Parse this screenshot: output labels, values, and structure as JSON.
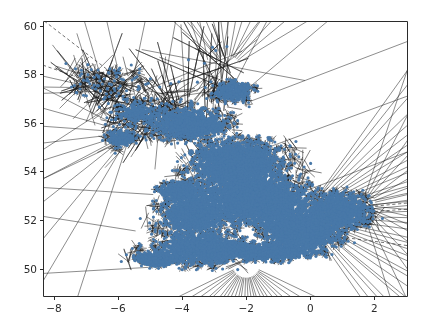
{
  "figure": {
    "background_color": "#ffffff",
    "axes_color": "#2b2b2b",
    "width": 427,
    "height": 334
  },
  "chart_data": {
    "type": "scatter",
    "title": "",
    "subtitle": "",
    "xlabel": "",
    "ylabel": "",
    "grid": false,
    "legend": null,
    "plot_kind": "voronoi-diagram",
    "xlim": [
      -8.34,
      3.02
    ],
    "ylim": [
      48.87,
      60.2
    ],
    "xticks": [
      -8,
      -6,
      -4,
      -2,
      0,
      2
    ],
    "xticklabels": [
      "−8",
      "−6",
      "−4",
      "−2",
      "0",
      "2"
    ],
    "yticks": [
      50,
      52,
      54,
      56,
      58,
      60
    ],
    "yticklabels": [
      "50",
      "52",
      "54",
      "56",
      "58",
      "60"
    ],
    "point_color": "#4878a8",
    "point_size": 2.0,
    "ridge_color": "#1a1a1a",
    "ridge_width": 0.55,
    "infinite_ridge_style": "dashed",
    "axes_box": {
      "left": 43,
      "top": 21,
      "right": 407,
      "bottom": 296
    },
    "clusters": [
      {
        "name": "scotland-northwest-sparse",
        "cx": -6.4,
        "cy": 57.6,
        "rx": 1.5,
        "ry": 1.2,
        "n": 70,
        "density": "sparse"
      },
      {
        "name": "scotland-central-belt",
        "cx": -3.9,
        "cy": 56.0,
        "rx": 1.3,
        "ry": 0.75,
        "n": 900,
        "density": "dense"
      },
      {
        "name": "scotland-aberdeen",
        "cx": -2.4,
        "cy": 57.3,
        "rx": 0.6,
        "ry": 0.45,
        "n": 420,
        "density": "dense"
      },
      {
        "name": "scotland-glasgow-edinburgh",
        "cx": -3.6,
        "cy": 55.9,
        "rx": 0.85,
        "ry": 0.35,
        "n": 1100,
        "density": "dense"
      },
      {
        "name": "northern-england",
        "cx": -2.3,
        "cy": 54.3,
        "rx": 1.5,
        "ry": 1.1,
        "n": 2600,
        "density": "dense"
      },
      {
        "name": "midlands",
        "cx": -1.6,
        "cy": 52.8,
        "rx": 1.6,
        "ry": 1.0,
        "n": 3400,
        "density": "very-dense"
      },
      {
        "name": "wales",
        "cx": -3.6,
        "cy": 52.3,
        "rx": 1.1,
        "ry": 1.1,
        "n": 1400,
        "density": "dense"
      },
      {
        "name": "south-east-london",
        "cx": -0.3,
        "cy": 51.6,
        "rx": 1.2,
        "ry": 0.8,
        "n": 3000,
        "density": "very-dense"
      },
      {
        "name": "east-anglia",
        "cx": 0.9,
        "cy": 52.4,
        "rx": 1.0,
        "ry": 0.8,
        "n": 1200,
        "density": "dense"
      },
      {
        "name": "south-west",
        "cx": -3.4,
        "cy": 50.8,
        "rx": 1.4,
        "ry": 0.7,
        "n": 1500,
        "density": "dense"
      },
      {
        "name": "cornwall",
        "cx": -4.8,
        "cy": 50.4,
        "rx": 0.7,
        "ry": 0.35,
        "n": 450,
        "density": "medium"
      },
      {
        "name": "north-wales-coast",
        "cx": -4.1,
        "cy": 53.2,
        "rx": 0.6,
        "ry": 0.4,
        "n": 500,
        "density": "medium"
      },
      {
        "name": "northern-ireland-edge",
        "cx": -5.9,
        "cy": 55.4,
        "rx": 0.5,
        "ry": 0.4,
        "n": 180,
        "density": "medium"
      },
      {
        "name": "isle-of-man-hebrides",
        "cx": -5.4,
        "cy": 56.4,
        "rx": 0.8,
        "ry": 0.6,
        "n": 240,
        "density": "medium"
      },
      {
        "name": "south-coast",
        "cx": -1.2,
        "cy": 50.7,
        "rx": 1.6,
        "ry": 0.4,
        "n": 1100,
        "density": "dense"
      }
    ],
    "sparse_points": [
      [
        -7.45,
        57.48
      ],
      [
        -7.36,
        57.54
      ],
      [
        -7.3,
        57.25
      ],
      [
        -7.18,
        57.95
      ],
      [
        -6.94,
        57.99
      ],
      [
        -6.8,
        57.45
      ],
      [
        -6.62,
        58.18
      ],
      [
        -6.55,
        57.32
      ],
      [
        -6.44,
        56.98
      ],
      [
        -6.36,
        57.2
      ],
      [
        -6.3,
        56.8
      ],
      [
        -6.2,
        57.58
      ],
      [
        -6.12,
        57.42
      ],
      [
        -6.05,
        57.9
      ],
      [
        -5.98,
        57.22
      ],
      [
        -5.92,
        56.58
      ],
      [
        -5.84,
        57.1
      ],
      [
        -5.75,
        56.42
      ],
      [
        -5.62,
        55.92
      ],
      [
        -5.58,
        56.3
      ],
      [
        -5.5,
        55.62
      ],
      [
        -5.44,
        56.12
      ],
      [
        -5.3,
        55.45
      ],
      [
        -5.12,
        55.3
      ],
      [
        -4.95,
        57.02
      ],
      [
        -4.7,
        57.48
      ],
      [
        -4.35,
        57.62
      ],
      [
        -4.1,
        57.7
      ],
      [
        -3.8,
        58.6
      ],
      [
        -3.3,
        58.46
      ],
      [
        -3.05,
        59.12
      ],
      [
        -2.95,
        58.98
      ],
      [
        -2.6,
        59.15
      ],
      [
        -3.52,
        57.68
      ],
      [
        -3.1,
        57.7
      ],
      [
        -2.82,
        57.62
      ],
      [
        -2.44,
        57.58
      ],
      [
        -4.62,
        56.12
      ],
      [
        -4.28,
        56.36
      ],
      [
        -3.96,
        56.52
      ],
      [
        -5.08,
        56.46
      ],
      [
        -4.52,
        55.98
      ]
    ]
  },
  "ticks": {
    "x": [
      {
        "label": "−8",
        "value": -8
      },
      {
        "label": "−6",
        "value": -6
      },
      {
        "label": "−4",
        "value": -4
      },
      {
        "label": "−2",
        "value": -2
      },
      {
        "label": "0",
        "value": 0
      },
      {
        "label": "2",
        "value": 2
      }
    ],
    "y": [
      {
        "label": "50",
        "value": 50
      },
      {
        "label": "52",
        "value": 52
      },
      {
        "label": "54",
        "value": 54
      },
      {
        "label": "56",
        "value": 56
      },
      {
        "label": "58",
        "value": 58
      },
      {
        "label": "60",
        "value": 60
      }
    ]
  }
}
